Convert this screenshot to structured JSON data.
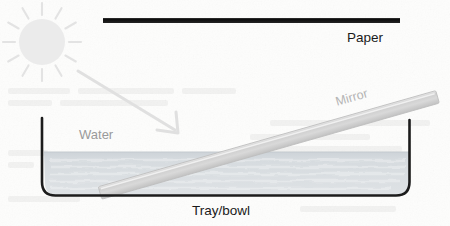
{
  "diagram": {
    "background_color": "#fdfdfc",
    "width": 450,
    "height": 226,
    "labels": {
      "paper": "Paper",
      "water": "Water",
      "mirror": "Mirror",
      "tray": "Tray/bowl"
    },
    "colors": {
      "paper_bar": "#111111",
      "paper_text": "#1a1a1a",
      "water_fill": "#d5dade",
      "water_text": "#9a9a9a",
      "mirror_fill": "#d2d2d2",
      "mirror_text": "#b4b4b4",
      "tray_outline": "#1c1c1c",
      "sun_fill": "#ebebeb",
      "sun_ray": "#e3e3e3",
      "arrow": "#e0e0e0",
      "tray_text": "#1a1a1a"
    },
    "elements": {
      "sun": {
        "name": "sun",
        "center_x": 42,
        "center_y": 42,
        "radius": 23,
        "ray_count": 12,
        "ray_inner": 27,
        "ray_outer": 39
      },
      "paper_bar": {
        "name": "paper",
        "x1": 103,
        "y1": 20.5,
        "x2": 400,
        "y2": 20.5,
        "thickness": 5
      },
      "sunlight_arrow": {
        "name": "sunlight-ray-arrow",
        "x1": 78,
        "y1": 71,
        "x2": 178,
        "y2": 132,
        "thickness": 3
      },
      "tray": {
        "name": "tray-bowl",
        "left_x": 42,
        "right_x": 410,
        "top_left_y": 118,
        "top_right_y": 120,
        "bottom_y": 196,
        "corner_radius": 13,
        "stroke_width": 2.6
      },
      "water": {
        "name": "water-body",
        "surface_y": 152,
        "bottom_y": 195,
        "left_x": 44,
        "right_x": 409
      },
      "mirror": {
        "name": "mirror",
        "x1": 100,
        "y1": 193,
        "x2": 437,
        "y2": 97,
        "thickness": 13
      }
    }
  }
}
